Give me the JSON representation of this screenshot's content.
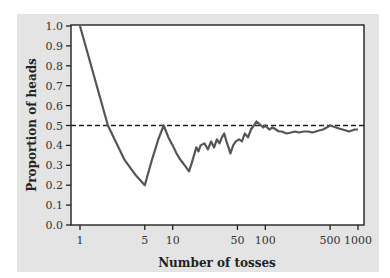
{
  "chart_data": {
    "type": "line",
    "title": "",
    "xlabel": "Number of tosses",
    "ylabel": "Proportion of heads",
    "xscale": "log",
    "xlim": [
      1,
      1000
    ],
    "ylim": [
      0.0,
      1.0
    ],
    "x_ticks": [
      1,
      5,
      10,
      50,
      100,
      500,
      1000
    ],
    "x_tick_labels": [
      "1",
      "5",
      "10",
      "50",
      "100",
      "500",
      "1000"
    ],
    "y_ticks": [
      0.0,
      0.1,
      0.2,
      0.3,
      0.4,
      0.5,
      0.6,
      0.7,
      0.8,
      0.9,
      1.0
    ],
    "y_tick_labels": [
      "0.0",
      "0.1",
      "0.2",
      "0.3",
      "0.4",
      "0.5",
      "0.6",
      "0.7",
      "0.8",
      "0.9",
      "1.0"
    ],
    "grid": false,
    "legend": null,
    "reference_line": {
      "y": 0.5,
      "style": "dashed",
      "color": "#222222"
    },
    "series": [
      {
        "name": "Proportion of heads",
        "color": "#555555",
        "x": [
          1,
          2,
          3,
          4,
          5,
          6,
          7,
          8,
          9,
          10,
          11,
          12,
          13,
          14,
          15,
          16,
          17,
          18,
          19,
          20,
          22,
          24,
          26,
          28,
          30,
          32,
          34,
          36,
          38,
          40,
          42,
          45,
          48,
          52,
          56,
          60,
          65,
          70,
          75,
          80,
          85,
          90,
          95,
          100,
          110,
          120,
          130,
          140,
          150,
          170,
          190,
          210,
          230,
          260,
          290,
          320,
          350,
          380,
          420,
          460,
          500,
          540,
          580,
          620,
          680,
          740,
          800,
          860,
          920,
          1000
        ],
        "values": [
          1.0,
          0.5,
          0.33,
          0.25,
          0.2,
          0.33,
          0.43,
          0.5,
          0.44,
          0.4,
          0.36,
          0.33,
          0.31,
          0.29,
          0.27,
          0.31,
          0.35,
          0.39,
          0.37,
          0.4,
          0.41,
          0.38,
          0.42,
          0.39,
          0.43,
          0.41,
          0.44,
          0.46,
          0.42,
          0.39,
          0.36,
          0.4,
          0.42,
          0.43,
          0.42,
          0.46,
          0.44,
          0.48,
          0.5,
          0.52,
          0.51,
          0.5,
          0.49,
          0.5,
          0.48,
          0.49,
          0.48,
          0.47,
          0.47,
          0.46,
          0.465,
          0.47,
          0.465,
          0.47,
          0.47,
          0.465,
          0.47,
          0.475,
          0.48,
          0.49,
          0.5,
          0.495,
          0.49,
          0.485,
          0.48,
          0.475,
          0.47,
          0.475,
          0.48,
          0.48
        ]
      }
    ]
  },
  "colors": {
    "panel_background": "#e4e4e4",
    "plot_background": "#ffffff",
    "axis": "#222222",
    "line": "#555555"
  }
}
